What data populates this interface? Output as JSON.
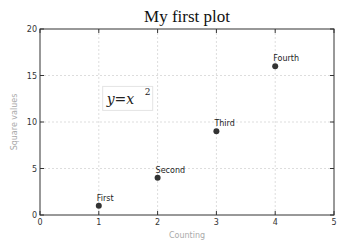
{
  "chart_data": {
    "type": "scatter",
    "title": "My first plot",
    "xlabel": "Counting",
    "ylabel": "Square values",
    "xlim": [
      0,
      5
    ],
    "ylim": [
      0,
      20
    ],
    "xticks": [
      0,
      1,
      2,
      3,
      4,
      5
    ],
    "yticks": [
      0,
      5,
      10,
      15,
      20
    ],
    "grid": true,
    "x": [
      1,
      2,
      3,
      4
    ],
    "y": [
      1,
      4,
      9,
      16
    ],
    "point_color": "#333333",
    "annotations": [
      {
        "text": "First",
        "x": 1,
        "y": 1
      },
      {
        "text": "Second",
        "x": 2,
        "y": 4
      },
      {
        "text": "Third",
        "x": 3,
        "y": 9
      },
      {
        "text": "Fourth",
        "x": 4,
        "y": 16
      }
    ],
    "equation": {
      "base": "y=x",
      "sup": "2",
      "x": 1.1,
      "y": 12
    }
  }
}
